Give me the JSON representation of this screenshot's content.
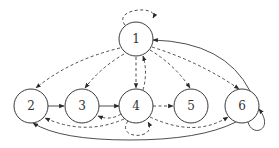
{
  "diagram": {
    "type": "directed-graph",
    "nodes": [
      {
        "id": "1",
        "label": "1"
      },
      {
        "id": "2",
        "label": "2"
      },
      {
        "id": "3",
        "label": "3"
      },
      {
        "id": "4",
        "label": "4"
      },
      {
        "id": "5",
        "label": "5"
      },
      {
        "id": "6",
        "label": "6"
      }
    ],
    "edges": [
      {
        "from": "1",
        "to": "1",
        "style": "dashed",
        "kind": "self-loop"
      },
      {
        "from": "1",
        "to": "2",
        "style": "dashed"
      },
      {
        "from": "1",
        "to": "3",
        "style": "dashed"
      },
      {
        "from": "1",
        "to": "4",
        "style": "dashed"
      },
      {
        "from": "4",
        "to": "1",
        "style": "dashed"
      },
      {
        "from": "1",
        "to": "5",
        "style": "dashed"
      },
      {
        "from": "1",
        "to": "6",
        "style": "dashed"
      },
      {
        "from": "2",
        "to": "3",
        "style": "solid"
      },
      {
        "from": "3",
        "to": "4",
        "style": "solid"
      },
      {
        "from": "4",
        "to": "3",
        "style": "dashed"
      },
      {
        "from": "4",
        "to": "2",
        "style": "dashed"
      },
      {
        "from": "4",
        "to": "4",
        "style": "dashed",
        "kind": "self-loop"
      },
      {
        "from": "4",
        "to": "5",
        "style": "dashed"
      },
      {
        "from": "4",
        "to": "6",
        "style": "dashed"
      },
      {
        "from": "6",
        "to": "1",
        "style": "solid"
      },
      {
        "from": "6",
        "to": "6",
        "style": "solid",
        "kind": "self-loop"
      },
      {
        "from": "6",
        "to": "2",
        "style": "solid"
      }
    ]
  }
}
